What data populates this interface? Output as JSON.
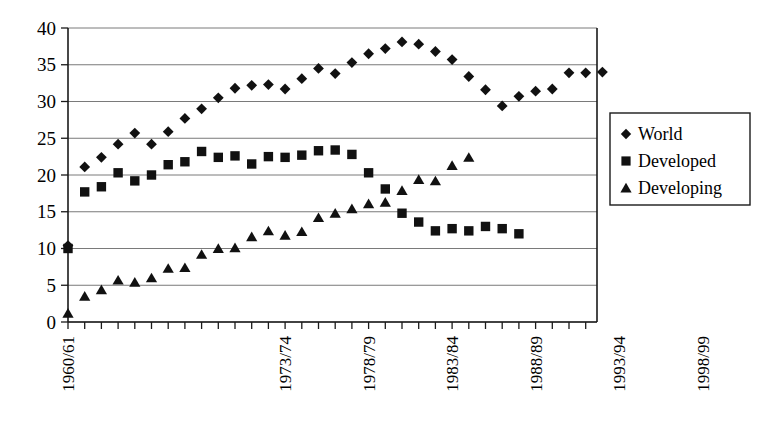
{
  "chart_data": {
    "type": "scatter",
    "title": "",
    "subtitle": "",
    "xlabel": "",
    "ylabel": "",
    "ylim": [
      0,
      40
    ],
    "y_ticks": [
      0,
      5,
      10,
      15,
      20,
      25,
      30,
      35,
      40
    ],
    "y_tick_labels": [
      "0",
      "5",
      "10",
      "15",
      "20",
      "25",
      "30",
      "35",
      "40"
    ],
    "grid": true,
    "grid_axis": "y",
    "legend_position": "right",
    "x_tick_labels_rotated": true,
    "x_tick_rotation_deg": -90,
    "x": [
      "1960/61",
      "1961/62",
      "1962/63",
      "1963/64",
      "1964/65",
      "1965/66",
      "1966/67",
      "1967/68",
      "1968/69",
      "1969/70",
      "1970/71",
      "1971/72",
      "1972/73",
      "1973/74",
      "1974/75",
      "1975/76",
      "1976/77",
      "1977/78",
      "1978/79",
      "1979/80",
      "1980/81",
      "1981/82",
      "1982/83",
      "1983/84",
      "1984/85",
      "1985/86",
      "1986/87",
      "1987/88",
      "1988/89",
      "1989/90",
      "1990/91",
      "1991/92",
      "1992/93",
      "1993/94",
      "1994/95",
      "1995/96",
      "1996/97",
      "1997/98",
      "1998/99",
      "1999/00"
    ],
    "x_labeled_ticks": [
      "1960/61",
      "1973/74",
      "1978/79",
      "1983/84",
      "1988/89",
      "1993/94",
      "1998/99"
    ],
    "x_labeled_indices": [
      0,
      13,
      18,
      23,
      28,
      33,
      38
    ],
    "categories": [
      "1960/61",
      "1961/62",
      "1962/63",
      "1963/64",
      "1964/65",
      "1965/66",
      "1966/67",
      "1967/68",
      "1968/69",
      "1969/70",
      "1970/71",
      "1971/72",
      "1972/73",
      "1973/74",
      "1974/75",
      "1975/76",
      "1976/77",
      "1977/78",
      "1978/79",
      "1979/80",
      "1980/81",
      "1981/82",
      "1982/83",
      "1983/84",
      "1984/85",
      "1985/86",
      "1986/87",
      "1987/88",
      "1988/89",
      "1989/90",
      "1990/91",
      "1991/92",
      "1992/93",
      "1993/94",
      "1994/95",
      "1995/96",
      "1996/97",
      "1997/98",
      "1998/99",
      "1999/00"
    ],
    "series": [
      {
        "name": "World",
        "marker": "diamond",
        "color": "#111111",
        "values": [
          10.4,
          21.1,
          22.4,
          24.2,
          25.7,
          24.2,
          25.9,
          27.7,
          29.0,
          30.5,
          31.8,
          32.2,
          32.3,
          31.7,
          33.1,
          34.5,
          33.8,
          35.3,
          36.5,
          37.2,
          38.1,
          37.8,
          36.8,
          35.7,
          33.4,
          31.6,
          29.4,
          30.7,
          31.4,
          31.7,
          33.9,
          33.9,
          34.0,
          null,
          null,
          null,
          null,
          null,
          null,
          null
        ]
      },
      {
        "name": "Developed",
        "marker": "square",
        "color": "#111111",
        "values": [
          10.0,
          17.7,
          18.4,
          20.3,
          19.2,
          20.0,
          21.4,
          21.8,
          23.2,
          22.4,
          22.6,
          21.5,
          22.5,
          22.4,
          22.7,
          23.3,
          23.4,
          22.8,
          20.3,
          18.1,
          14.8,
          13.6,
          12.4,
          12.7,
          12.4,
          13.0,
          12.7,
          12.0,
          null,
          null,
          null,
          null,
          null,
          null,
          null,
          null,
          null,
          null,
          null,
          null
        ]
      },
      {
        "name": "Developing",
        "marker": "triangle",
        "color": "#111111",
        "values": [
          1.2,
          3.5,
          4.4,
          5.7,
          5.4,
          6.0,
          7.3,
          7.4,
          9.2,
          10.0,
          10.1,
          11.6,
          12.4,
          11.8,
          12.3,
          14.2,
          14.8,
          15.4,
          16.1,
          16.3,
          17.9,
          19.4,
          19.2,
          21.3,
          22.4,
          null,
          null,
          null,
          null,
          null,
          null,
          null,
          null,
          null,
          null,
          null,
          null,
          null,
          null,
          null
        ]
      }
    ],
    "points": {
      "world": [
        [
          0,
          10.4
        ],
        [
          1,
          21.1
        ],
        [
          2,
          22.4
        ],
        [
          3,
          24.2
        ],
        [
          4,
          25.7
        ],
        [
          5,
          24.2
        ],
        [
          6,
          25.9
        ],
        [
          7,
          27.7
        ],
        [
          8,
          29.0
        ],
        [
          9,
          30.5
        ],
        [
          10,
          31.8
        ],
        [
          11,
          32.2
        ],
        [
          12,
          32.3
        ],
        [
          13,
          31.7
        ],
        [
          14,
          33.1
        ],
        [
          15,
          34.5
        ],
        [
          16,
          33.8
        ],
        [
          17,
          35.3
        ],
        [
          18,
          36.5
        ],
        [
          19,
          37.2
        ],
        [
          20,
          38.1
        ],
        [
          21,
          37.8
        ],
        [
          22,
          36.8
        ],
        [
          23,
          35.7
        ],
        [
          24,
          33.4
        ],
        [
          25,
          31.6
        ],
        [
          26,
          29.4
        ],
        [
          27,
          30.7
        ],
        [
          28,
          31.4
        ],
        [
          29,
          31.7
        ],
        [
          30,
          33.9
        ],
        [
          31,
          33.9
        ],
        [
          32,
          34.0
        ]
      ],
      "developed": [
        [
          0,
          10.0
        ],
        [
          1,
          17.7
        ],
        [
          2,
          18.4
        ],
        [
          3,
          20.3
        ],
        [
          4,
          19.2
        ],
        [
          5,
          20.0
        ],
        [
          6,
          21.4
        ],
        [
          7,
          21.8
        ],
        [
          8,
          23.2
        ],
        [
          9,
          22.4
        ],
        [
          10,
          22.6
        ],
        [
          11,
          21.5
        ],
        [
          12,
          22.5
        ],
        [
          13,
          22.4
        ],
        [
          14,
          22.7
        ],
        [
          15,
          23.3
        ],
        [
          16,
          23.4
        ],
        [
          17,
          22.8
        ],
        [
          18,
          20.3
        ],
        [
          19,
          18.1
        ],
        [
          20,
          14.8
        ],
        [
          21,
          13.6
        ],
        [
          22,
          12.4
        ],
        [
          23,
          12.7
        ],
        [
          24,
          12.4
        ],
        [
          25,
          13.0
        ],
        [
          26,
          12.7
        ],
        [
          27,
          12.0
        ]
      ],
      "developing": [
        [
          0,
          1.2
        ],
        [
          1,
          3.5
        ],
        [
          2,
          4.4
        ],
        [
          3,
          5.7
        ],
        [
          4,
          5.4
        ],
        [
          5,
          6.0
        ],
        [
          6,
          7.3
        ],
        [
          7,
          7.4
        ],
        [
          8,
          9.2
        ],
        [
          9,
          10.0
        ],
        [
          10,
          10.1
        ],
        [
          11,
          11.6
        ],
        [
          12,
          12.4
        ],
        [
          13,
          11.8
        ],
        [
          14,
          12.3
        ],
        [
          15,
          14.2
        ],
        [
          16,
          14.8
        ],
        [
          17,
          15.4
        ],
        [
          18,
          16.1
        ],
        [
          19,
          16.3
        ],
        [
          20,
          17.9
        ],
        [
          21,
          19.4
        ],
        [
          22,
          19.2
        ],
        [
          23,
          21.3
        ],
        [
          24,
          22.4
        ]
      ]
    },
    "point_spacing_index": {
      "world_start_index": 0,
      "developed_start_index": 0,
      "developing_start_index": 0
    }
  },
  "legend": {
    "entries": [
      {
        "label": "World",
        "marker": "diamond"
      },
      {
        "label": "Developed",
        "marker": "square"
      },
      {
        "label": "Developing",
        "marker": "triangle"
      }
    ]
  },
  "axes": {
    "y_labels": [
      "40",
      "35",
      "30",
      "25",
      "20",
      "15",
      "10",
      "5",
      "0"
    ],
    "x_labels": [
      "1960/61",
      "1973/74",
      "1978/79",
      "1983/84",
      "1988/89",
      "1993/94",
      "1998/99"
    ]
  }
}
